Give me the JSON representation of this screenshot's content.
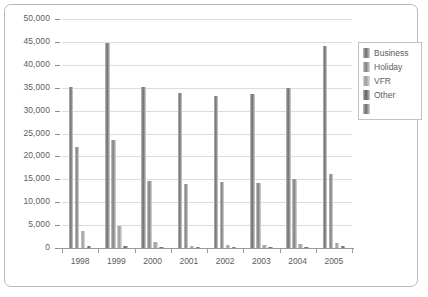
{
  "chart_data": {
    "type": "bar",
    "title": "",
    "subtitle": "",
    "xlabel": "",
    "ylabel": "",
    "grid": true,
    "legend_position": "right",
    "ylim": [
      0,
      50000
    ],
    "ytick_labels": [
      "50,000",
      "45,000",
      "40,000",
      "35,000",
      "30,000",
      "25,000",
      "20,000",
      "15,000",
      "10,000",
      "5,000",
      "0"
    ],
    "ytick_values": [
      50000,
      45000,
      40000,
      35000,
      30000,
      25000,
      20000,
      15000,
      10000,
      5000,
      0
    ],
    "categories": [
      "1998",
      "1999",
      "2000",
      "2001",
      "2002",
      "2003",
      "2004",
      "2005"
    ],
    "series": [
      {
        "name": "Business",
        "values": [
          35200,
          44800,
          35200,
          33900,
          33200,
          33700,
          34900,
          44200
        ]
      },
      {
        "name": "Holiday",
        "values": [
          22100,
          23500,
          14600,
          13900,
          14400,
          14300,
          15100,
          16200
        ]
      },
      {
        "name": "VFR",
        "values": [
          3800,
          4700,
          1300,
          500,
          600,
          700,
          900,
          1100
        ]
      },
      {
        "name": "Other",
        "values": [
          400,
          500,
          300,
          300,
          300,
          300,
          300,
          400
        ]
      }
    ]
  },
  "legend": {
    "items": [
      {
        "label": "Business"
      },
      {
        "label": "Holiday"
      },
      {
        "label": "VFR"
      },
      {
        "label": "Other"
      },
      {
        "label": ""
      }
    ]
  }
}
